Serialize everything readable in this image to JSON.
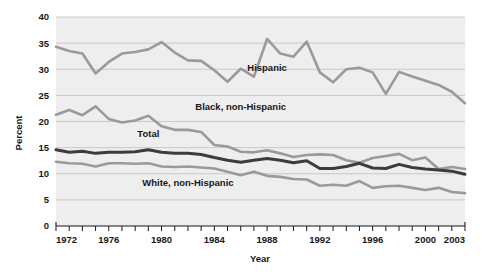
{
  "chart_data": {
    "type": "line",
    "title": "",
    "xlabel": "Year",
    "ylabel": "Percent",
    "xlim": [
      1972,
      2003
    ],
    "ylim": [
      0,
      40
    ],
    "ytick_values": [
      0,
      5,
      10,
      15,
      20,
      25,
      30,
      35,
      40
    ],
    "ytick_labels": [
      "0",
      "5",
      "10",
      "15",
      "20",
      "25",
      "30",
      "35",
      "40"
    ],
    "xtick_labels": [
      "1972",
      "1976",
      "1980",
      "1984",
      "1988",
      "1992",
      "1996",
      "2000",
      "2003"
    ],
    "xtick_label_values": [
      1972,
      1976,
      1980,
      1984,
      1988,
      1992,
      1996,
      2000,
      2003
    ],
    "grid": "horizontal",
    "legend_position": "inline-annotations",
    "x": [
      1972,
      1973,
      1974,
      1975,
      1976,
      1977,
      1978,
      1979,
      1980,
      1981,
      1982,
      1983,
      1984,
      1985,
      1986,
      1987,
      1988,
      1989,
      1990,
      1991,
      1992,
      1993,
      1994,
      1995,
      1996,
      1997,
      1998,
      1999,
      2000,
      2001,
      2002,
      2003
    ],
    "series": [
      {
        "name": "Hispanic",
        "color": "#9a9a9a",
        "label_x": 1988,
        "label_y": 29.6,
        "values": [
          34.3,
          33.5,
          33.0,
          29.2,
          31.4,
          33.0,
          33.3,
          33.8,
          35.2,
          33.2,
          31.7,
          31.6,
          29.8,
          27.6,
          30.1,
          28.6,
          35.8,
          33.0,
          32.4,
          35.3,
          29.4,
          27.5,
          30.0,
          30.3,
          29.4,
          25.3,
          29.5,
          28.6,
          27.8,
          27.0,
          25.7,
          23.5
        ]
      },
      {
        "name": "Black, non-Hispanic",
        "color": "#9a9a9a",
        "label_x": 1986,
        "label_y": 22.2,
        "values": [
          21.3,
          22.2,
          21.2,
          22.9,
          20.5,
          19.8,
          20.2,
          21.1,
          19.1,
          18.4,
          18.4,
          18.0,
          15.5,
          15.2,
          14.2,
          14.1,
          14.5,
          13.9,
          13.2,
          13.6,
          13.7,
          13.6,
          12.6,
          12.1,
          13.0,
          13.4,
          13.8,
          12.6,
          13.1,
          10.9,
          11.3,
          10.9
        ]
      },
      {
        "name": "Total",
        "color": "#3c3c3c",
        "label_x": 1979,
        "label_y": 17.0,
        "values": [
          14.6,
          14.1,
          14.3,
          13.9,
          14.1,
          14.1,
          14.2,
          14.6,
          14.1,
          13.9,
          13.9,
          13.7,
          13.1,
          12.6,
          12.2,
          12.6,
          12.9,
          12.6,
          12.1,
          12.5,
          11.0,
          11.0,
          11.4,
          12.0,
          11.1,
          11.0,
          11.8,
          11.2,
          10.9,
          10.7,
          10.5,
          9.9
        ]
      },
      {
        "name": "White, non-Hispanic",
        "color": "#9a9a9a",
        "label_x": 1982,
        "label_y": 7.6,
        "values": [
          12.3,
          12.0,
          11.9,
          11.4,
          12.0,
          12.0,
          11.9,
          12.0,
          11.4,
          11.3,
          11.4,
          11.2,
          11.0,
          10.4,
          9.7,
          10.4,
          9.6,
          9.4,
          9.0,
          8.9,
          7.7,
          7.9,
          7.7,
          8.6,
          7.3,
          7.6,
          7.7,
          7.3,
          6.9,
          7.3,
          6.5,
          6.3
        ]
      }
    ]
  }
}
